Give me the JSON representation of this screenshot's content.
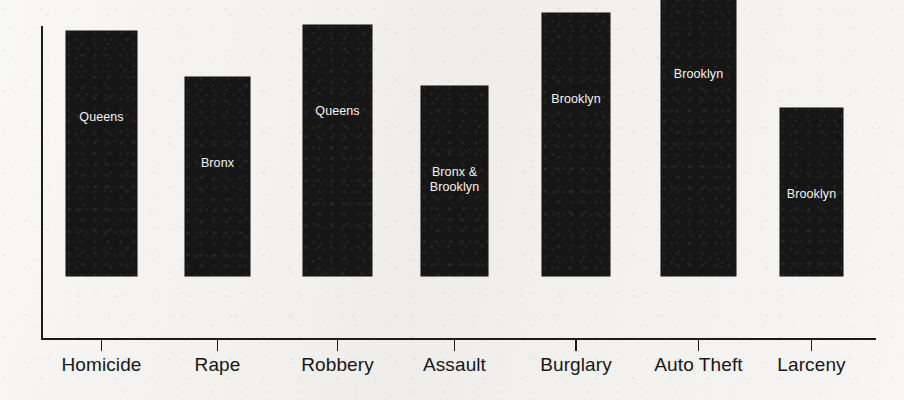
{
  "chart_data": {
    "type": "bar",
    "title": "",
    "subtitle": "",
    "xlabel": "",
    "ylabel": "",
    "ylim": [
      0,
      100
    ],
    "grid": false,
    "legend": "none",
    "axis_tick_labels": [],
    "categories": [
      "Homicide",
      "Rape",
      "Robbery",
      "Assault",
      "Burglary",
      "Auto Theft",
      "Larceny"
    ],
    "values": [
      79,
      64,
      81,
      61,
      85,
      93,
      54
    ],
    "value_labels": [
      "79%",
      "64%",
      "81%",
      "61%",
      "85%",
      "93%",
      "54%"
    ],
    "bar_annotations": [
      "Queens",
      "Bronx",
      "Queens",
      "Bronx &\nBrooklyn",
      "Brooklyn",
      "Brooklyn",
      "Brooklyn"
    ],
    "series": [
      {
        "name": "",
        "points": [
          {
            "category": "Homicide",
            "value": 79,
            "value_label": "79%",
            "annotation": "Queens"
          },
          {
            "category": "Rape",
            "value": 64,
            "value_label": "64%",
            "annotation": "Bronx"
          },
          {
            "category": "Robbery",
            "value": 81,
            "value_label": "81%",
            "annotation": "Queens"
          },
          {
            "category": "Assault",
            "value": 61,
            "value_label": "61%",
            "annotation": "Bronx &\nBrooklyn"
          },
          {
            "category": "Burglary",
            "value": 85,
            "value_label": "85%",
            "annotation": "Brooklyn"
          },
          {
            "category": "Auto Theft",
            "value": 93,
            "value_label": "93%",
            "annotation": "Brooklyn"
          },
          {
            "category": "Larceny",
            "value": 54,
            "value_label": "54%",
            "annotation": "Brooklyn"
          }
        ]
      }
    ]
  },
  "colors": {
    "bar": "#161616",
    "background": "#f3f2ef",
    "axis": "#1b1b1b",
    "value_text": "#161616",
    "inner_label_text": "#f4f4f4"
  },
  "bars": [
    {
      "value_label": "79%",
      "annotation": "Queens",
      "category": "Homicide"
    },
    {
      "value_label": "64%",
      "annotation": "Bronx",
      "category": "Rape"
    },
    {
      "value_label": "81%",
      "annotation": "Queens",
      "category": "Robbery"
    },
    {
      "value_label": "61%",
      "annotation": "Bronx &\nBrooklyn",
      "category": "Assault"
    },
    {
      "value_label": "85%",
      "annotation": "Brooklyn",
      "category": "Burglary"
    },
    {
      "value_label": "93%",
      "annotation": "Brooklyn",
      "category": "Auto Theft"
    },
    {
      "value_label": "54%",
      "annotation": "Brooklyn",
      "category": "Larceny"
    }
  ]
}
